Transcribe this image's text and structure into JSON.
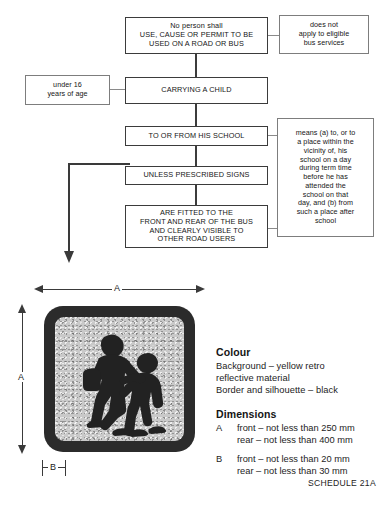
{
  "document": {
    "title": "School bus sign requirements flowchart and sign specification",
    "schedule_ref": "SCHEDULE 21A"
  },
  "flowchart": {
    "main_boxes": [
      {
        "id": "use-cause-permit",
        "text": "No person shall\nUSE, CAUSE OR PERMIT TO BE\nUSED ON A ROAD OR BUS"
      },
      {
        "id": "carrying-a-child",
        "text": "CARRYING A CHILD"
      },
      {
        "id": "to-or-from-school",
        "text": "TO OR FROM HIS SCHOOL"
      },
      {
        "id": "unless-prescribed-signs",
        "text": "UNLESS PRESCRIBED SIGNS"
      },
      {
        "id": "are-fitted",
        "text": "ARE FITTED TO THE\nFRONT AND REAR OF THE BUS\nAND CLEARLY VISIBLE TO\nOTHER ROAD USERS"
      }
    ],
    "annotation_boxes": [
      {
        "id": "eligible-bus-services",
        "text": "does not\napply to eligible\nbus services"
      },
      {
        "id": "under-16",
        "text": "under 16\nyears of age"
      },
      {
        "id": "school-definition",
        "text": "means (a) to, or to\na place within the\nvicinity of, his\nschool on a day\nduring term time\nbefore he has\nattended the\nschool on that\nday, and (b) from\nsuch a place after\nschool"
      }
    ]
  },
  "sign": {
    "dimension_labels": {
      "width": "A",
      "height": "A",
      "border": "B"
    },
    "colors": {
      "border": "#2b2b2b",
      "background": "#c9c9c9",
      "silhouette": "#222222"
    }
  },
  "legend": {
    "colour_heading": "Colour",
    "colour_lines": "Background – yellow retro\nreflective material\nBorder and silhouette – black",
    "dimensions_heading": "Dimensions",
    "dimension_rows": [
      {
        "key": "A",
        "value": "front – not less than 250 mm\nrear – not less than 400 mm"
      },
      {
        "key": "B",
        "value": "front – not less than 20 mm\nrear – not less than 30 mm"
      }
    ]
  }
}
